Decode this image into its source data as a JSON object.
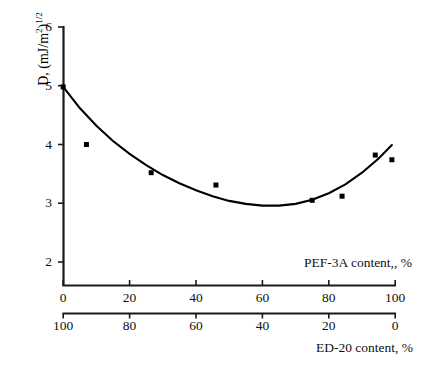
{
  "chart_data": {
    "type": "scatter",
    "title": "",
    "ylabel": "D, (mJ/m2)1/2",
    "ylabel_parts": {
      "base": "D, (mJ/m",
      "sup1": "2",
      "mid": ")",
      "sup2": "1/2"
    },
    "xlabel_top": "PEF-3A content,, %",
    "xlabel_bottom": "ED-20 content, %",
    "grid": false,
    "legend": "none",
    "xlim": [
      0,
      100
    ],
    "ylim": [
      1.55,
      6
    ],
    "y_axis_visible_range": [
      2,
      6
    ],
    "yticks": [
      2,
      3,
      4,
      5,
      6
    ],
    "ytick_labels": [
      "2",
      "3",
      "4",
      "5",
      "6"
    ],
    "xticks_top": [
      0,
      20,
      40,
      60,
      80,
      100
    ],
    "xtick_labels_top": [
      "0",
      "20",
      "40",
      "60",
      "80",
      "100"
    ],
    "xticks_bottom": [
      100,
      80,
      60,
      40,
      20,
      0
    ],
    "xtick_labels_bottom": [
      "100",
      "80",
      "60",
      "40",
      "20",
      "0"
    ],
    "series": [
      {
        "name": "measured",
        "marker": "square",
        "color": "#000000",
        "x": [
          0,
          7,
          26.5,
          46,
          75,
          84,
          94,
          99
        ],
        "y": [
          4.98,
          4.0,
          3.52,
          3.31,
          3.05,
          3.12,
          3.82,
          3.74
        ]
      },
      {
        "name": "fit-curve",
        "type": "line",
        "color": "#000000",
        "x": [
          0,
          5,
          10,
          15,
          20,
          25,
          30,
          35,
          40,
          45,
          50,
          55,
          60,
          65,
          70,
          75,
          80,
          85,
          90,
          95,
          99
        ],
        "y": [
          4.98,
          4.62,
          4.32,
          4.06,
          3.84,
          3.65,
          3.48,
          3.34,
          3.22,
          3.12,
          3.04,
          2.99,
          2.96,
          2.96,
          2.99,
          3.06,
          3.17,
          3.32,
          3.52,
          3.76,
          3.99
        ]
      }
    ]
  },
  "colors": {
    "axis": "#1a1a1a",
    "marker": "#000000",
    "curve": "#000000",
    "background": "#ffffff"
  }
}
